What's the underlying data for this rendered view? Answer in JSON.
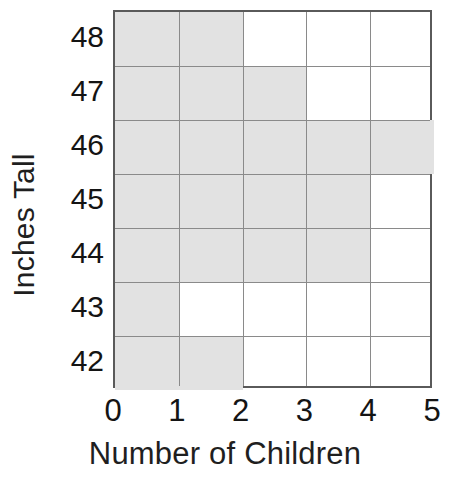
{
  "chart_data": {
    "type": "bar",
    "orientation": "horizontal",
    "title": "",
    "xlabel": "Number of Children",
    "ylabel": "Inches Tall",
    "categories": [
      "48",
      "47",
      "46",
      "45",
      "44",
      "43",
      "42"
    ],
    "values": [
      2,
      3,
      5,
      4,
      4,
      1,
      2
    ],
    "x_tick_labels": [
      "0",
      "1",
      "2",
      "3",
      "4",
      "5"
    ],
    "y_tick_labels": [
      "48",
      "47",
      "46",
      "45",
      "44",
      "43",
      "42"
    ],
    "xlim": [
      0,
      5
    ],
    "grid": true,
    "legend": "none",
    "bar_fill_color": "#e2e2e2",
    "grid_line_color": "#8a8a8a",
    "axis_border_color": "#5a5a5a",
    "text_color": "#141414",
    "background_color": "#ffffff"
  }
}
